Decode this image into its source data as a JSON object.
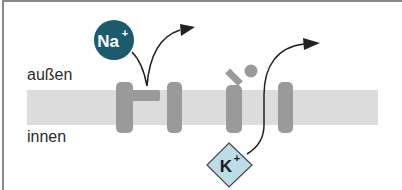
{
  "labels": {
    "outside": "außen",
    "inside": "innen"
  },
  "ions": {
    "sodium": {
      "symbol": "Na",
      "charge": "+",
      "fill": "#1c5a6e",
      "text_color": "#ffffff"
    },
    "potassium": {
      "symbol": "K",
      "charge": "+",
      "fill": "#bcdce8",
      "text_color": "#1a1a1a"
    }
  },
  "colors": {
    "membrane": "#dcdcdc",
    "channel": "#9a9a9a",
    "arrow": "#222222",
    "border": "#8a8a8a"
  }
}
